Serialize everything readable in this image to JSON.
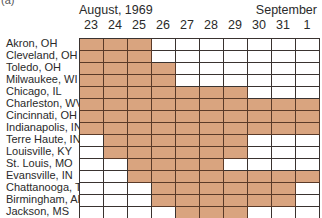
{
  "panel_label": "(a)",
  "header": {
    "month_left": "August, 1969",
    "month_right": "September"
  },
  "chart_data": {
    "type": "table",
    "title": "",
    "months": [
      "August, 1969",
      "September"
    ],
    "days": [
      "23",
      "24",
      "25",
      "26",
      "27",
      "28",
      "29",
      "30",
      "31",
      "1"
    ],
    "fill_color": "#d9a47f",
    "rows": [
      {
        "city": "Akron, OH",
        "shaded": [
          1,
          1,
          1,
          0,
          0,
          0,
          0,
          0,
          0,
          0
        ]
      },
      {
        "city": "Cleveland, OH",
        "shaded": [
          1,
          1,
          1,
          0,
          0,
          0,
          0,
          0,
          0,
          0
        ]
      },
      {
        "city": "Toledo, OH",
        "shaded": [
          1,
          1,
          1,
          1,
          0,
          0,
          0,
          0,
          0,
          0
        ]
      },
      {
        "city": "Milwaukee, WI",
        "shaded": [
          1,
          1,
          1,
          1,
          0,
          0,
          0,
          0,
          0,
          0
        ]
      },
      {
        "city": "Chicago, IL",
        "shaded": [
          1,
          1,
          1,
          1,
          1,
          1,
          1,
          0,
          0,
          0
        ]
      },
      {
        "city": "Charleston, WV",
        "shaded": [
          1,
          1,
          1,
          1,
          1,
          1,
          1,
          1,
          1,
          1
        ]
      },
      {
        "city": "Cincinnati, OH",
        "shaded": [
          1,
          1,
          1,
          1,
          1,
          1,
          1,
          1,
          1,
          1
        ]
      },
      {
        "city": "Indianapolis, IN",
        "shaded": [
          1,
          1,
          1,
          1,
          1,
          1,
          1,
          1,
          1,
          1
        ]
      },
      {
        "city": "Terre Haute, IN",
        "shaded": [
          0,
          1,
          1,
          1,
          1,
          1,
          1,
          0,
          0,
          0
        ]
      },
      {
        "city": "Louisville, KY",
        "shaded": [
          0,
          1,
          1,
          1,
          1,
          1,
          1,
          0,
          0,
          0
        ]
      },
      {
        "city": "St. Louis, MO",
        "shaded": [
          0,
          0,
          1,
          1,
          1,
          1,
          0,
          0,
          0,
          0
        ]
      },
      {
        "city": "Evansville, IN",
        "shaded": [
          0,
          0,
          1,
          1,
          1,
          1,
          1,
          1,
          1,
          1
        ]
      },
      {
        "city": "Chattanooga, TN",
        "shaded": [
          0,
          0,
          0,
          1,
          1,
          1,
          1,
          1,
          1,
          0
        ]
      },
      {
        "city": "Birmingham, AL",
        "shaded": [
          0,
          0,
          0,
          1,
          1,
          1,
          1,
          1,
          1,
          0
        ]
      },
      {
        "city": "Jackson, MS",
        "shaded": [
          0,
          0,
          0,
          0,
          1,
          1,
          1,
          0,
          0,
          0
        ]
      }
    ]
  }
}
